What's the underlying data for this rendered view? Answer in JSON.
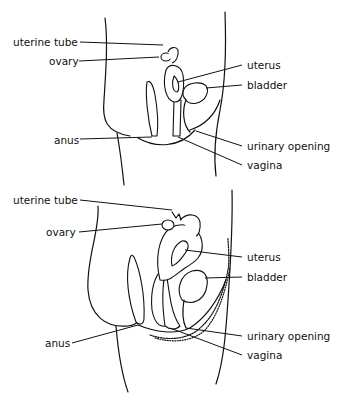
{
  "diagrams": [
    {
      "id": "top",
      "labels": {
        "uterine_tube": "uterine tube",
        "ovary": "ovary",
        "uterus": "uterus",
        "bladder": "bladder",
        "anus": "anus",
        "urinary_opening": "urinary opening",
        "vagina": "vagina"
      }
    },
    {
      "id": "bottom",
      "labels": {
        "uterine_tube": "uterine tube",
        "ovary": "ovary",
        "uterus": "uterus",
        "bladder": "bladder",
        "anus": "anus",
        "urinary_opening": "urinary opening",
        "vagina": "vagina"
      }
    }
  ],
  "colors": {
    "ink": "#111111",
    "background": "#ffffff"
  }
}
